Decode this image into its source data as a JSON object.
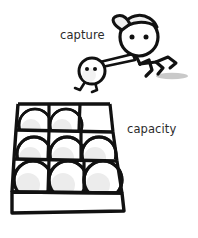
{
  "canvas": {
    "width": 198,
    "height": 238,
    "background": "#ffffff"
  },
  "style": {
    "ink": "#111111",
    "text_color": "#2b2b2b",
    "ball_fill": "#ffffff",
    "ball_shade": "#e9e9e9",
    "shadow_color": "#c9c9c9",
    "cap_fill": "#efefef",
    "stroke_width_thick": 3.2,
    "stroke_width_medium": 2.2,
    "stroke_width_thin": 1.8
  },
  "labels": {
    "capture": {
      "text": "capture",
      "x": 60,
      "y": 39,
      "font_size": 11.5
    },
    "capacity": {
      "text": "capacity",
      "x": 127,
      "y": 133,
      "font_size": 11.5
    }
  },
  "runner": {
    "name": "running-figure-with-cap",
    "head": {
      "cx": 139,
      "cy": 37,
      "r": 19
    },
    "eyes": [
      {
        "cx": 132,
        "cy": 36,
        "r": 2.4
      },
      {
        "cx": 146,
        "cy": 36,
        "r": 2.4
      }
    ],
    "cap": {
      "description": "baseball cap with brim pointing left"
    },
    "arm": {
      "description": "outstretched left arm carrying small figure"
    },
    "legs": {
      "description": "zig-zag stick legs mid-stride"
    },
    "shadow": {
      "cx": 172,
      "cy": 76,
      "rx": 16,
      "ry": 3.2
    }
  },
  "captured": {
    "name": "small-captured-figure",
    "head": {
      "cx": 92,
      "cy": 71,
      "r": 13
    },
    "eyes": [
      {
        "cx": 87,
        "cy": 69,
        "r": 1.9
      },
      {
        "cx": 95,
        "cy": 69,
        "r": 1.9
      }
    ],
    "legs": {
      "description": "two short dangling legs"
    }
  },
  "crate": {
    "name": "ball-crate",
    "rows": 3,
    "columns": 3,
    "total_cells": 9,
    "balls_present": 8,
    "empty_cells": 1,
    "empty_cell": {
      "row": 0,
      "column": 2,
      "position": "back-right"
    },
    "cells": [
      {
        "row": 0,
        "col": 0,
        "occupied": true
      },
      {
        "row": 0,
        "col": 1,
        "occupied": true
      },
      {
        "row": 0,
        "col": 2,
        "occupied": false
      },
      {
        "row": 1,
        "col": 0,
        "occupied": true
      },
      {
        "row": 1,
        "col": 1,
        "occupied": true
      },
      {
        "row": 1,
        "col": 2,
        "occupied": true
      },
      {
        "row": 2,
        "col": 0,
        "occupied": true
      },
      {
        "row": 2,
        "col": 1,
        "occupied": true
      },
      {
        "row": 2,
        "col": 2,
        "occupied": true
      }
    ],
    "front_panel": {
      "description": "front face of crate below bottom row"
    }
  }
}
